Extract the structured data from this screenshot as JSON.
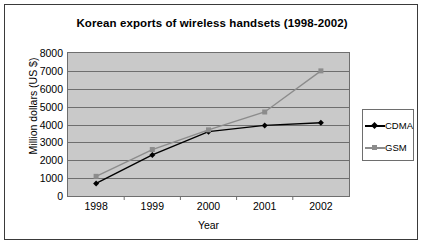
{
  "chart_data": {
    "type": "line",
    "title": "Korean exports of wireless handsets (1998-2002)",
    "xlabel": "Year",
    "ylabel": "Million dollars (US $)",
    "categories": [
      "1998",
      "1999",
      "2000",
      "2001",
      "2002"
    ],
    "ylim": [
      0,
      8000
    ],
    "ytick_labels": [
      "8000",
      "7000",
      "6000",
      "5000",
      "4000",
      "3000",
      "2000",
      "1000",
      "0"
    ],
    "ytick_values": [
      8000,
      7000,
      6000,
      5000,
      4000,
      3000,
      2000,
      1000,
      0
    ],
    "grid": true,
    "legend_position": "right",
    "series": [
      {
        "name": "CDMA",
        "color": "#000000",
        "marker": "diamond",
        "values": [
          700,
          2300,
          3600,
          3950,
          4100
        ]
      },
      {
        "name": "GSM",
        "color": "#8c8c8c",
        "marker": "square",
        "values": [
          1100,
          2600,
          3700,
          4700,
          7000
        ]
      }
    ]
  },
  "style": {
    "plot_background": "#c9c9c9",
    "gridline_color": "#6e6e6e",
    "frame_border": "#3a3a3a",
    "text_color": "#000000"
  }
}
